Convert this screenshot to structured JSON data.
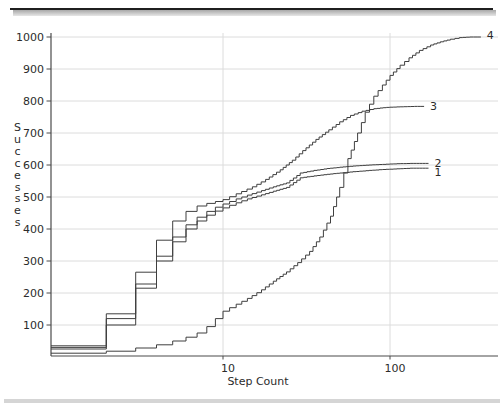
{
  "chart_data": {
    "type": "line",
    "subtype": "staircase-cdf",
    "title": "",
    "xlabel": "Step Count",
    "ylabel": "Successes",
    "x_scale": "log",
    "xlim": [
      1,
      350
    ],
    "ylim": [
      0,
      1000
    ],
    "grid": true,
    "x_ticks": [
      {
        "label": "10",
        "value": 10
      },
      {
        "label": "100",
        "value": 100
      }
    ],
    "y_ticks": [
      {
        "label": "1000",
        "value": 1000
      },
      {
        "label": "900",
        "value": 900
      },
      {
        "label": "800",
        "value": 800
      },
      {
        "label": "700",
        "value": 700
      },
      {
        "label": "600",
        "value": 600
      },
      {
        "label": "500",
        "value": 500
      },
      {
        "label": "400",
        "value": 400
      },
      {
        "label": "300",
        "value": 300
      },
      {
        "label": "200",
        "value": 200
      },
      {
        "label": "100",
        "value": 100
      }
    ],
    "series": [
      {
        "name": "1",
        "label_dy": 4,
        "points": [
          [
            1,
            25
          ],
          [
            2,
            100
          ],
          [
            3,
            215
          ],
          [
            4,
            300
          ],
          [
            5,
            360
          ],
          [
            6,
            400
          ],
          [
            7,
            425
          ],
          [
            8,
            443
          ],
          [
            9,
            456
          ],
          [
            10,
            466
          ],
          [
            12,
            482
          ],
          [
            14,
            494
          ],
          [
            17,
            507
          ],
          [
            20,
            518
          ],
          [
            24,
            530
          ],
          [
            29,
            560
          ],
          [
            35,
            566
          ],
          [
            42,
            571
          ],
          [
            50,
            575
          ],
          [
            60,
            579
          ],
          [
            75,
            583
          ],
          [
            90,
            586
          ],
          [
            110,
            588
          ],
          [
            132,
            590
          ],
          [
            170,
            590
          ]
        ]
      },
      {
        "name": "2",
        "label_dy": 0,
        "points": [
          [
            1,
            30
          ],
          [
            2,
            120
          ],
          [
            3,
            228
          ],
          [
            4,
            315
          ],
          [
            5,
            375
          ],
          [
            6,
            413
          ],
          [
            7,
            437
          ],
          [
            8,
            455
          ],
          [
            9,
            468
          ],
          [
            10,
            478
          ],
          [
            12,
            494
          ],
          [
            14,
            506
          ],
          [
            17,
            520
          ],
          [
            20,
            532
          ],
          [
            24,
            544
          ],
          [
            29,
            575
          ],
          [
            35,
            583
          ],
          [
            42,
            589
          ],
          [
            50,
            593
          ],
          [
            60,
            597
          ],
          [
            75,
            600
          ],
          [
            90,
            602
          ],
          [
            110,
            604
          ],
          [
            132,
            605
          ],
          [
            170,
            605
          ]
        ]
      },
      {
        "name": "3",
        "label_dy": 0,
        "points": [
          [
            1,
            35
          ],
          [
            2,
            135
          ],
          [
            3,
            265
          ],
          [
            4,
            365
          ],
          [
            5,
            425
          ],
          [
            6,
            455
          ],
          [
            7,
            472
          ],
          [
            8,
            480
          ],
          [
            9,
            486
          ],
          [
            10,
            492
          ],
          [
            12,
            510
          ],
          [
            15,
            532
          ],
          [
            18,
            555
          ],
          [
            22,
            585
          ],
          [
            26,
            615
          ],
          [
            30,
            645
          ],
          [
            36,
            680
          ],
          [
            43,
            710
          ],
          [
            50,
            735
          ],
          [
            58,
            755
          ],
          [
            68,
            768
          ],
          [
            80,
            776
          ],
          [
            95,
            780
          ],
          [
            115,
            782
          ],
          [
            140,
            783
          ],
          [
            160,
            783
          ]
        ]
      },
      {
        "name": "4",
        "label_dy": -2,
        "points": [
          [
            1,
            12
          ],
          [
            2,
            18
          ],
          [
            3,
            28
          ],
          [
            4,
            38
          ],
          [
            5,
            50
          ],
          [
            6,
            62
          ],
          [
            7,
            75
          ],
          [
            8,
            95
          ],
          [
            9,
            120
          ],
          [
            10,
            143
          ],
          [
            12,
            165
          ],
          [
            14,
            183
          ],
          [
            17,
            210
          ],
          [
            20,
            237
          ],
          [
            24,
            266
          ],
          [
            28,
            295
          ],
          [
            33,
            330
          ],
          [
            38,
            375
          ],
          [
            44,
            440
          ],
          [
            50,
            530
          ],
          [
            56,
            620
          ],
          [
            64,
            700
          ],
          [
            71,
            765
          ],
          [
            80,
            815
          ],
          [
            90,
            850
          ],
          [
            100,
            880
          ],
          [
            115,
            912
          ],
          [
            130,
            935
          ],
          [
            150,
            958
          ],
          [
            175,
            975
          ],
          [
            200,
            985
          ],
          [
            230,
            993
          ],
          [
            260,
            998
          ],
          [
            300,
            1000
          ],
          [
            350,
            1000
          ]
        ]
      }
    ],
    "colors": {
      "curve": "#3f3f3f",
      "axis": "#4a4a4a",
      "grid": "#dcdcdc",
      "text": "#2b2b2b",
      "top_rule": "#1f1f1f",
      "top_shadow_from": "#a8a8a8",
      "top_shadow_to": "#e6e6e6",
      "bottom_band": "#d5d5d5"
    },
    "geometry": {
      "x_of_step1": 56,
      "px_per_decade": 167,
      "y_of_zero": 357,
      "px_per_unit": 0.32,
      "plot_left": 51,
      "plot_right": 498,
      "plot_top": 33,
      "plot_bottom": 356
    }
  }
}
